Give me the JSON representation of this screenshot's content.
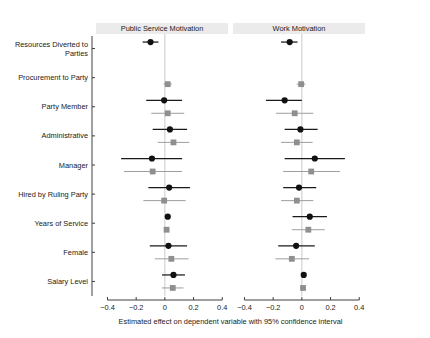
{
  "chart_data": {
    "type": "scatter",
    "title": "",
    "xlabel": "Estimated effect on dependent variable with 95% confidence interval",
    "ylabel": "",
    "xlim": [
      -0.48,
      0.44
    ],
    "xticks": [
      -0.4,
      -0.2,
      0,
      0.2,
      0.4
    ],
    "xticklabels": [
      "−0.4",
      "−0.2",
      "0",
      "0.2",
      "0.4"
    ],
    "grid": false,
    "zero_reference_line": true,
    "legend_position": "none",
    "panels": [
      {
        "label": "Public Service Motivation",
        "series": [
          {
            "name": "Model A",
            "marker": "circle",
            "color": "#111111",
            "values": [
              {
                "category": "Resources Diverted to Parties",
                "estimate": -0.1,
                "ci_low": -0.155,
                "ci_high": -0.045
              },
              {
                "category": "Party Member",
                "estimate": -0.005,
                "ci_low": -0.13,
                "ci_high": 0.12
              },
              {
                "category": "Administrative",
                "estimate": 0.035,
                "ci_low": -0.085,
                "ci_high": 0.155
              },
              {
                "category": "Manager",
                "estimate": -0.09,
                "ci_low": -0.305,
                "ci_high": 0.12
              },
              {
                "category": "Hired by Ruling Party",
                "estimate": 0.03,
                "ci_low": -0.115,
                "ci_high": 0.175
              },
              {
                "category": "Years of Service",
                "estimate": 0.02,
                "ci_low": 0.008,
                "ci_high": 0.032
              },
              {
                "category": "Female",
                "estimate": 0.025,
                "ci_low": -0.105,
                "ci_high": 0.155
              },
              {
                "category": "Salary Level",
                "estimate": 0.06,
                "ci_low": -0.02,
                "ci_high": 0.14
              }
            ]
          },
          {
            "name": "Model B",
            "marker": "square",
            "color": "#8f8f8f",
            "values": [
              {
                "category": "Procurement to Party",
                "estimate": 0.02,
                "ci_low": -0.008,
                "ci_high": 0.048
              },
              {
                "category": "Party Member",
                "estimate": 0.02,
                "ci_low": -0.095,
                "ci_high": 0.135
              },
              {
                "category": "Administrative",
                "estimate": 0.06,
                "ci_low": -0.05,
                "ci_high": 0.17
              },
              {
                "category": "Manager",
                "estimate": -0.085,
                "ci_low": -0.285,
                "ci_high": 0.12
              },
              {
                "category": "Hired by Ruling Party",
                "estimate": -0.005,
                "ci_low": -0.15,
                "ci_high": 0.145
              },
              {
                "category": "Years of Service",
                "estimate": 0.012,
                "ci_low": 0.002,
                "ci_high": 0.024
              },
              {
                "category": "Female",
                "estimate": 0.045,
                "ci_low": -0.07,
                "ci_high": 0.165
              },
              {
                "category": "Salary Level",
                "estimate": 0.055,
                "ci_low": -0.02,
                "ci_high": 0.13
              }
            ]
          }
        ]
      },
      {
        "label": "Work Motivation",
        "series": [
          {
            "name": "Model A",
            "marker": "circle",
            "color": "#111111",
            "values": [
              {
                "category": "Resources Diverted to Parties",
                "estimate": -0.085,
                "ci_low": -0.145,
                "ci_high": -0.03
              },
              {
                "category": "Party Member",
                "estimate": -0.12,
                "ci_low": -0.25,
                "ci_high": 0.0
              },
              {
                "category": "Administrative",
                "estimate": -0.01,
                "ci_low": -0.12,
                "ci_high": 0.11
              },
              {
                "category": "Manager",
                "estimate": 0.09,
                "ci_low": -0.12,
                "ci_high": 0.3
              },
              {
                "category": "Hired by Ruling Party",
                "estimate": -0.02,
                "ci_low": -0.13,
                "ci_high": 0.1
              },
              {
                "category": "Years of Service",
                "estimate": 0.055,
                "ci_low": -0.065,
                "ci_high": 0.175
              },
              {
                "category": "Female",
                "estimate": -0.04,
                "ci_low": -0.165,
                "ci_high": 0.09
              },
              {
                "category": "Salary Level",
                "estimate": 0.013,
                "ci_low": 0.002,
                "ci_high": 0.024
              }
            ]
          },
          {
            "name": "Model B",
            "marker": "square",
            "color": "#8f8f8f",
            "values": [
              {
                "category": "Procurement to Party",
                "estimate": -0.005,
                "ci_low": -0.035,
                "ci_high": 0.025
              },
              {
                "category": "Party Member",
                "estimate": -0.05,
                "ci_low": -0.18,
                "ci_high": 0.08
              },
              {
                "category": "Administrative",
                "estimate": -0.035,
                "ci_low": -0.145,
                "ci_high": 0.075
              },
              {
                "category": "Manager",
                "estimate": 0.065,
                "ci_low": -0.13,
                "ci_high": 0.265
              },
              {
                "category": "Hired by Ruling Party",
                "estimate": -0.035,
                "ci_low": -0.145,
                "ci_high": 0.08
              },
              {
                "category": "Years of Service",
                "estimate": 0.045,
                "ci_low": -0.07,
                "ci_high": 0.16
              },
              {
                "category": "Female",
                "estimate": -0.07,
                "ci_low": -0.185,
                "ci_high": 0.05
              },
              {
                "category": "Salary Level",
                "estimate": 0.008,
                "ci_low": -0.002,
                "ci_high": 0.018
              }
            ]
          }
        ]
      }
    ],
    "categories": [
      "Resources Diverted to Parties",
      "Procurement to Party",
      "Party Member",
      "Administrative",
      "Manager",
      "Hired by Ruling Party",
      "Years of Service",
      "Female",
      "Salary Level"
    ],
    "category_labels": [
      [
        "Resources Diverted to",
        "Parties"
      ],
      [
        "Procurement to Party"
      ],
      [
        "Party Member"
      ],
      [
        "Administrative"
      ],
      [
        "Manager"
      ],
      [
        "Hired by Ruling Party"
      ],
      [
        "Years of Service"
      ],
      [
        "Female"
      ],
      [
        "Salary Level"
      ]
    ]
  },
  "colors": {
    "series_a": "#111111",
    "series_b": "#8f8f8f",
    "strip_background": "#ebebeb",
    "axis": "#2b2b2b",
    "zero_line": "#bdbdbd",
    "panel_border": "#9a9a9a"
  }
}
